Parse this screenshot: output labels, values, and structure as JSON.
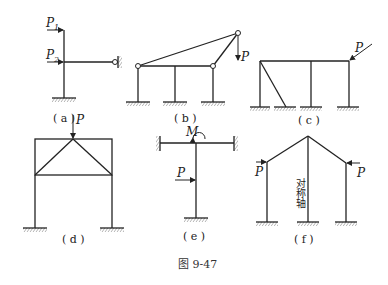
{
  "figure": {
    "caption": "图 9-47",
    "panels": [
      {
        "id": "a",
        "caption": "( a )",
        "loads": [
          {
            "label": "P",
            "subscript": "1"
          },
          {
            "label": "P",
            "subscript": "2"
          }
        ]
      },
      {
        "id": "b",
        "caption": "( b )",
        "loads": [
          {
            "label": "P"
          }
        ]
      },
      {
        "id": "c",
        "caption": "( c )",
        "loads": [
          {
            "label": "P"
          }
        ]
      },
      {
        "id": "d",
        "caption": "( d )",
        "loads": [
          {
            "label": "P"
          }
        ]
      },
      {
        "id": "e",
        "caption": "( e )",
        "loads": [
          {
            "label": "M"
          },
          {
            "label": "P"
          }
        ]
      },
      {
        "id": "f",
        "caption": "( f )",
        "loads": [
          {
            "label": "P"
          },
          {
            "label": "P"
          }
        ],
        "axis_label": "对称轴"
      }
    ]
  }
}
